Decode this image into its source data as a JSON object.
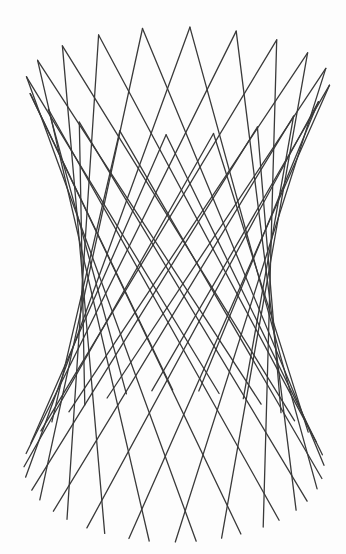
{
  "figure": {
    "title": "Hyperboloid of one sheet (ruled surface)",
    "line_color": "#3a3a3a",
    "line_width": 1.3,
    "background": "#fdfdfd",
    "top_ellipse": {
      "cx": 178,
      "cy": 81,
      "rx": 152,
      "ry": 54
    },
    "bottom_ellipse": {
      "cx": 174,
      "cy": 466,
      "rx": 150,
      "ry": 76
    },
    "rulings_per_family": 20,
    "twist_degrees": 103,
    "families": [
      "left-twist",
      "right-twist"
    ],
    "waist": {
      "y": 270,
      "left_x": 84,
      "right_x": 272
    }
  },
  "bleed_through_text": {
    "legible": false,
    "lines": [
      "",
      "",
      "",
      "",
      "",
      "",
      "",
      "",
      "",
      "",
      "",
      "",
      "",
      ""
    ]
  }
}
